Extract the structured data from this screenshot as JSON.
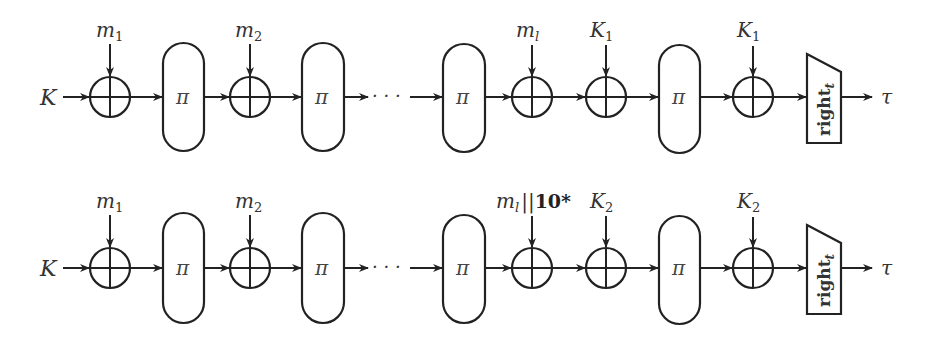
{
  "diagram": {
    "rows": [
      {
        "id": "row1",
        "input": "K",
        "output": "τ",
        "dots": "· · ·",
        "inputs": {
          "m1": "m",
          "m1_sub": "1",
          "m2": "m",
          "m2_sub": "2",
          "ml": "m",
          "ml_sub": "l",
          "k_a": "K",
          "k_a_sub": "1",
          "k_b": "K",
          "k_b_sub": "1"
        },
        "permutation": "π",
        "truncate": "right",
        "truncate_sub": "t"
      },
      {
        "id": "row2",
        "input": "K",
        "output": "τ",
        "dots": "· · ·",
        "inputs": {
          "m1": "m",
          "m1_sub": "1",
          "m2": "m",
          "m2_sub": "2",
          "ml": "m",
          "ml_sub": "l",
          "ml_pad": "||",
          "ml_pad_bits": "10*",
          "k_a": "K",
          "k_a_sub": "2",
          "k_b": "K",
          "k_b_sub": "2"
        },
        "permutation": "π",
        "truncate": "right",
        "truncate_sub": "t"
      }
    ]
  }
}
